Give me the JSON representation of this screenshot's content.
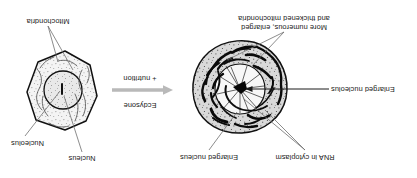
{
  "figure": {
    "orientation": "rotated-180",
    "background_color": "#ffffff",
    "ink_color": "#1a1a1a",
    "arrow_color": "#b9b9b9",
    "cytoplasm_fill_left": "#d8d8d8",
    "cytoplasm_fill_right": "#f2f2f2"
  },
  "transition": {
    "line1": "Ecdysone",
    "line2": "+ nutrition",
    "arrow_direction": "left",
    "arrow_icon": "left-arrow-icon"
  },
  "left_cell": {
    "name": "stimulated-cell",
    "shape": "round",
    "labels": [
      {
        "id": "rna-in-cytoplasm",
        "text": "RNA in cytoplasm"
      },
      {
        "id": "enlarged-nucleus",
        "text": "Enlarged nucleus"
      },
      {
        "id": "enlarged-nucleolus",
        "text": "Enlarged nucleolus"
      },
      {
        "id": "mitochondria",
        "text": "More numerous, enlarged\nand thickened mitochondria"
      }
    ]
  },
  "right_cell": {
    "name": "resting-cell",
    "shape": "polygonal",
    "labels": [
      {
        "id": "nucleus",
        "text": "Nucleus"
      },
      {
        "id": "nucleolus",
        "text": "Nucleolus"
      },
      {
        "id": "mitochondria",
        "text": "Mitochondria"
      }
    ]
  }
}
